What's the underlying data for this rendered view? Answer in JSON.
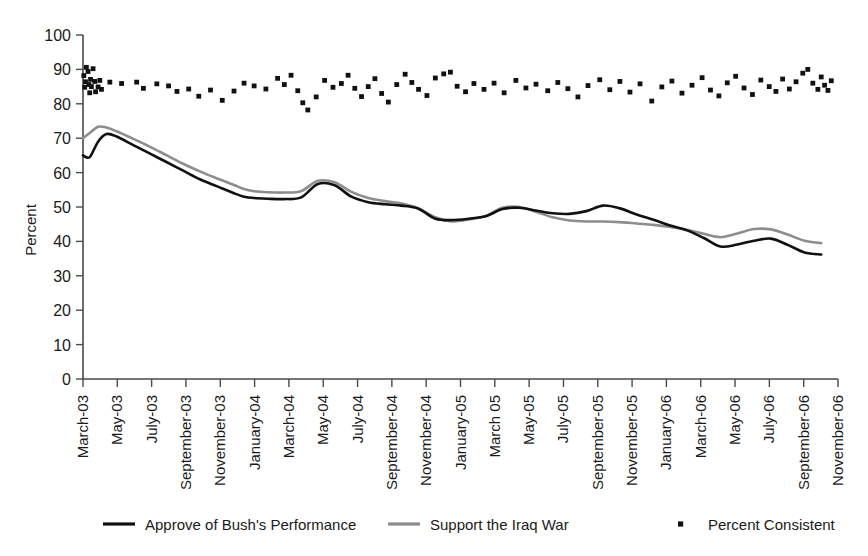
{
  "chart_data": {
    "type": "line",
    "title": "",
    "xlabel": "",
    "ylabel": "Percent",
    "ylim": [
      0,
      100
    ],
    "ytick_labels": [
      "100",
      "90",
      "80",
      "70",
      "60",
      "50",
      "40",
      "30",
      "20",
      "10",
      "0"
    ],
    "ytick_values": [
      100,
      90,
      80,
      70,
      60,
      50,
      40,
      30,
      20,
      10,
      0
    ],
    "grid": false,
    "legend_position": "bottom",
    "categories": [
      "March-03",
      "May-03",
      "July-03",
      "September-03",
      "November-03",
      "January-04",
      "March-04",
      "May-04",
      "July-04",
      "September-04",
      "November-04",
      "January-05",
      "March 05",
      "May-05",
      "July-05",
      "September-05",
      "November-05",
      "January-06",
      "March-06",
      "May-06",
      "July-06",
      "September-06",
      "November-06"
    ],
    "x_range_months": 45,
    "series": [
      {
        "name": "Approve of Bush's Performance",
        "type": "line",
        "color": "#111111",
        "x": [
          0,
          0.4,
          0.9,
          1.4,
          2,
          3,
          4,
          5,
          6,
          7,
          8,
          9,
          9.6,
          10.2,
          11,
          12,
          13,
          14,
          15,
          16,
          17,
          18,
          19,
          20,
          21,
          22,
          23,
          24,
          25,
          26,
          27,
          28,
          29,
          30,
          31,
          32,
          33,
          34,
          35,
          36,
          37,
          38,
          39,
          40,
          41,
          42,
          43,
          44
        ],
        "values": [
          65,
          64.5,
          69,
          71.2,
          70.5,
          68,
          65.5,
          63,
          60.5,
          58,
          56,
          54,
          53,
          52.6,
          52.4,
          52.3,
          52.8,
          56.7,
          56.3,
          53,
          51.4,
          50.8,
          50.4,
          49.5,
          46.6,
          46.2,
          46.6,
          47.3,
          49.4,
          49.8,
          49,
          48.2,
          48,
          48.8,
          50.4,
          49.6,
          47.8,
          46.3,
          44.6,
          43.2,
          41,
          38.5,
          39.1,
          40.2,
          40.8,
          39,
          36.8,
          36.2
        ]
      },
      {
        "name": "Support the Iraq War",
        "type": "line",
        "color": "#8d8d8d",
        "x": [
          0,
          0.4,
          0.9,
          1.4,
          2,
          3,
          4,
          5,
          6,
          7,
          8,
          9,
          9.6,
          10.2,
          11,
          12,
          13,
          14,
          15,
          16,
          17,
          18,
          19,
          20,
          21,
          22,
          23,
          24,
          25,
          26,
          27,
          28,
          29,
          30,
          31,
          32,
          33,
          34,
          35,
          36,
          37,
          38,
          39,
          40,
          41,
          42,
          43,
          44
        ],
        "values": [
          70,
          71.5,
          73.3,
          73.1,
          72,
          69.8,
          67.5,
          65,
          62.5,
          60.3,
          58.3,
          56.4,
          55.2,
          54.6,
          54.3,
          54.2,
          54.6,
          57.6,
          57.2,
          54.4,
          52.6,
          51.7,
          51,
          49.6,
          47,
          45.8,
          46.4,
          47.4,
          49.8,
          50,
          48.6,
          47,
          46.1,
          45.8,
          45.8,
          45.6,
          45.2,
          44.8,
          44.2,
          43.4,
          42.2,
          41.2,
          42.3,
          43.6,
          43.5,
          42,
          40.2,
          39.5
        ]
      },
      {
        "name": "Percent Consistent",
        "type": "scatter",
        "color": "#111111",
        "points": [
          [
            0.05,
            88.2
          ],
          [
            0.1,
            84.8
          ],
          [
            0.15,
            86.4
          ],
          [
            0.2,
            90.6
          ],
          [
            0.3,
            89.4
          ],
          [
            0.35,
            85.6
          ],
          [
            0.4,
            83.2
          ],
          [
            0.45,
            87.1
          ],
          [
            0.5,
            85.0
          ],
          [
            0.6,
            90.2
          ],
          [
            0.7,
            86.5
          ],
          [
            0.75,
            83.5
          ],
          [
            0.9,
            84.9
          ],
          [
            1.0,
            86.8
          ],
          [
            1.1,
            84.2
          ],
          [
            1.6,
            86.3
          ],
          [
            2.3,
            85.9
          ],
          [
            3.2,
            86.3
          ],
          [
            3.6,
            84.5
          ],
          [
            4.4,
            85.8
          ],
          [
            5.1,
            85.2
          ],
          [
            5.6,
            83.6
          ],
          [
            6.3,
            84.3
          ],
          [
            6.9,
            82.2
          ],
          [
            7.6,
            84.0
          ],
          [
            8.3,
            81.0
          ],
          [
            9.0,
            83.7
          ],
          [
            9.6,
            86.0
          ],
          [
            10.2,
            85.2
          ],
          [
            10.9,
            84.3
          ],
          [
            11.6,
            87.4
          ],
          [
            12.0,
            85.6
          ],
          [
            12.4,
            88.3
          ],
          [
            12.8,
            83.8
          ],
          [
            13.1,
            80.3
          ],
          [
            13.4,
            78.2
          ],
          [
            13.9,
            82.0
          ],
          [
            14.4,
            86.8
          ],
          [
            14.9,
            84.8
          ],
          [
            15.4,
            85.9
          ],
          [
            15.8,
            88.3
          ],
          [
            16.2,
            84.5
          ],
          [
            16.6,
            82.1
          ],
          [
            17.0,
            85.0
          ],
          [
            17.4,
            87.3
          ],
          [
            17.8,
            83.0
          ],
          [
            18.2,
            80.5
          ],
          [
            18.7,
            85.6
          ],
          [
            19.2,
            88.6
          ],
          [
            19.6,
            86.2
          ],
          [
            20.0,
            84.2
          ],
          [
            20.5,
            82.4
          ],
          [
            21.0,
            87.5
          ],
          [
            21.5,
            88.7
          ],
          [
            21.9,
            89.2
          ],
          [
            22.3,
            85.1
          ],
          [
            22.8,
            83.5
          ],
          [
            23.3,
            85.9
          ],
          [
            23.9,
            84.2
          ],
          [
            24.5,
            86.0
          ],
          [
            25.1,
            83.2
          ],
          [
            25.8,
            86.8
          ],
          [
            26.4,
            84.6
          ],
          [
            27.0,
            85.7
          ],
          [
            27.7,
            83.8
          ],
          [
            28.3,
            86.2
          ],
          [
            28.9,
            84.4
          ],
          [
            29.5,
            82.0
          ],
          [
            30.1,
            85.3
          ],
          [
            30.8,
            87.0
          ],
          [
            31.4,
            84.1
          ],
          [
            32.0,
            86.5
          ],
          [
            32.6,
            83.4
          ],
          [
            33.2,
            85.8
          ],
          [
            33.9,
            80.8
          ],
          [
            34.5,
            84.9
          ],
          [
            35.1,
            86.6
          ],
          [
            35.7,
            83.1
          ],
          [
            36.3,
            85.4
          ],
          [
            36.9,
            87.6
          ],
          [
            37.4,
            84.0
          ],
          [
            37.9,
            82.3
          ],
          [
            38.4,
            86.1
          ],
          [
            38.9,
            88.0
          ],
          [
            39.4,
            84.6
          ],
          [
            39.9,
            82.7
          ],
          [
            40.4,
            86.9
          ],
          [
            40.9,
            85.0
          ],
          [
            41.3,
            83.6
          ],
          [
            41.7,
            87.2
          ],
          [
            42.1,
            84.3
          ],
          [
            42.5,
            86.4
          ],
          [
            42.9,
            88.9
          ],
          [
            43.2,
            90.0
          ],
          [
            43.5,
            86.0
          ],
          [
            43.8,
            84.2
          ],
          [
            44.0,
            87.8
          ],
          [
            44.2,
            85.4
          ],
          [
            44.4,
            83.9
          ],
          [
            44.6,
            86.7
          ]
        ]
      }
    ],
    "legend": [
      {
        "label": "Approve of Bush's Performance",
        "marker": "line",
        "color": "#111111"
      },
      {
        "label": "Support the Iraq War",
        "marker": "line",
        "color": "#8d8d8d"
      },
      {
        "label": "Percent Consistent",
        "marker": "square",
        "color": "#111111"
      }
    ]
  }
}
